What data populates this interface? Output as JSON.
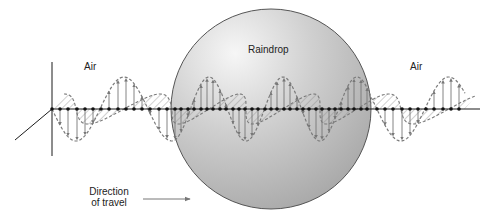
{
  "diagram": {
    "labels": {
      "air_left": "Air",
      "raindrop": "Raindrop",
      "air_right": "Air",
      "direction_line1": "Direction",
      "direction_line2": "of travel"
    },
    "colors": {
      "background": "#ffffff",
      "axis": "#1a1a1a",
      "wave_stroke": "#7a7a7a",
      "hatch": "#8c8c8c",
      "raindrop_light": "#f2f2f2",
      "raindrop_mid": "#c9c9c9",
      "raindrop_dark": "#a9a9a9",
      "raindrop_edge": "#555555",
      "text": "#222222"
    },
    "geometry": {
      "axis_y": 109,
      "axis_x_start": 52,
      "axis_x_end": 480,
      "vertical_axis": {
        "x": 52,
        "y_top": 62,
        "y_bottom": 156
      },
      "diagonal_axis": {
        "x1": 52,
        "y1": 109,
        "x2": 15,
        "y2": 140
      },
      "raindrop": {
        "cx": 271,
        "cy": 109,
        "r": 100
      },
      "direction_arrow": {
        "x1": 143,
        "y1": 199,
        "x2": 190,
        "y2": 199
      }
    },
    "waves": {
      "e_field_amplitude": 32,
      "b_field_amplitude": 20,
      "air_wavelength": 96,
      "raindrop_wavelength": 74,
      "segments": [
        {
          "medium": "air",
          "x_start": 52,
          "x_end": 172,
          "phase_start": 0.75
        },
        {
          "medium": "water",
          "x_start": 172,
          "x_end": 371
        },
        {
          "medium": "air",
          "x_start": 371,
          "x_end": 465
        }
      ]
    }
  }
}
